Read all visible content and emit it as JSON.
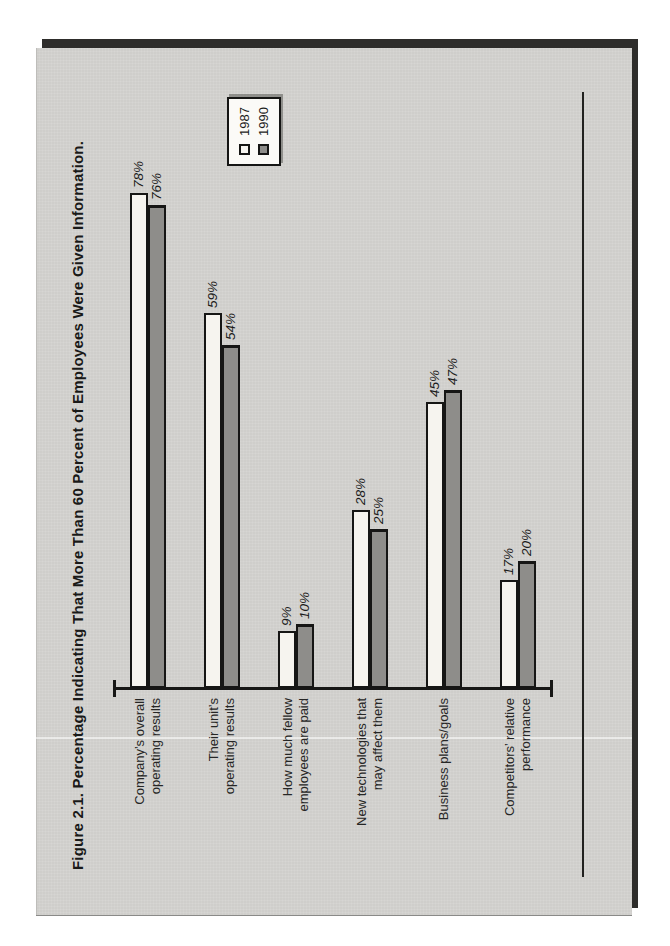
{
  "chart_data": {
    "type": "bar",
    "orientation": "horizontal bars; whole figure printed rotated 90° CCW on a portrait page",
    "title": "Figure 2.1. Percentage Indicating That More Than 60 Percent of Employees Were Given Information.",
    "categories": [
      "Company’s overall operating results",
      "Their unit’s operating results",
      "How much fellow employees are paid",
      "New technologies that may affect them",
      "Business plans/goals",
      "Competitors’ relative performance"
    ],
    "category_label_lines": [
      [
        "Company’s overall",
        "operating results"
      ],
      [
        "Their unit’s",
        "operating results"
      ],
      [
        "How much fellow",
        "employees are paid"
      ],
      [
        "New technologies that",
        "may affect them"
      ],
      [
        "Business plans/goals"
      ],
      [
        "Competitors’ relative",
        "performance"
      ]
    ],
    "series": [
      {
        "name": "1987",
        "color_hex": "#f6f4ef",
        "values": [
          78,
          59,
          9,
          28,
          45,
          17
        ]
      },
      {
        "name": "1990",
        "color_hex": "#8e8d8a",
        "values": [
          76,
          54,
          10,
          25,
          47,
          20
        ]
      }
    ],
    "value_suffix": "%",
    "xlabel": "",
    "ylabel": "",
    "axis_range_percent": [
      0,
      100
    ],
    "grid": "off",
    "legend_position": "top-right of figure",
    "ink_color_hex": "#171716",
    "page_color_hex": "#d3d2cf",
    "book_edge_color_hex": "#2e2d2b"
  }
}
